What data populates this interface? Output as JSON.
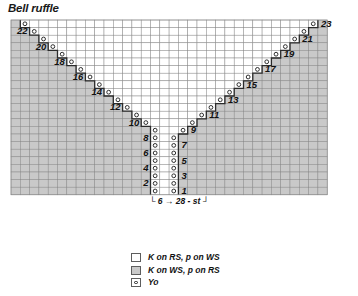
{
  "title": "Bell ruffle",
  "chart_data": {
    "type": "table",
    "title": "Bell ruffle",
    "grid": {
      "columns": 34,
      "rows": 23,
      "cell_width": 9.3,
      "cell_height": 7.6
    },
    "row_numbers_left": [
      22,
      20,
      18,
      16,
      14,
      12,
      10,
      8,
      6,
      4,
      2
    ],
    "row_numbers_right": [
      23,
      21,
      19,
      17,
      15,
      13,
      11,
      9,
      7,
      5,
      3,
      1
    ],
    "bottom_annotation": "6 → 28 - st",
    "bottom_annotation_parts": {
      "start": "6",
      "arrow": "→",
      "end": "28 - st"
    },
    "symbols": {
      "white": "K on RS, p on WS",
      "gray": "K on WS, p on RS",
      "circle": "Yo"
    }
  },
  "legend": {
    "items": [
      {
        "swatch": "white",
        "label": "K on RS, p on WS"
      },
      {
        "swatch": "gray",
        "label": "K on WS, p on RS"
      },
      {
        "swatch": "circle",
        "label": "Yo"
      }
    ]
  },
  "colors": {
    "gray_fill": "#c9c9c9",
    "white_fill": "#ffffff",
    "grid_line": "#8a8a8a",
    "outline": "#2b2b2b",
    "text": "#111111"
  }
}
